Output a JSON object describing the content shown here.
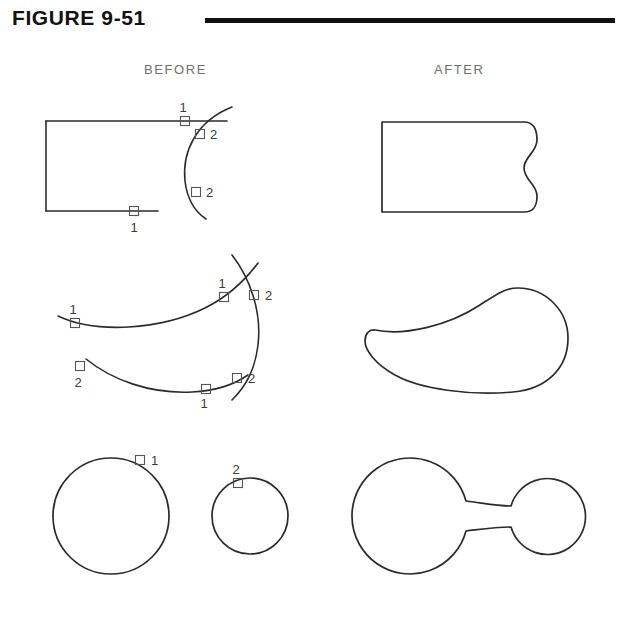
{
  "figure": {
    "title": "FIGURE 9-51",
    "rule_color": "#111111"
  },
  "columns": {
    "before_label": "BEFORE",
    "after_label": "AFTER"
  },
  "style": {
    "line_color": "#2b2b2b",
    "marker_stroke": "#555555",
    "label_color": "#3a3a3a",
    "caption_color": "#6f6f6f",
    "background": "#ffffff"
  },
  "rows": [
    {
      "id": "row-1",
      "name": "rectangle-and-arc",
      "before": {
        "description": "Open rectangle with top and bottom lines extending right, crossed by a convex arc",
        "markers": [
          {
            "label": "1",
            "x": 185,
            "y": 121,
            "label_x": 183,
            "label_y": 112,
            "anchor": "middle"
          },
          {
            "label": "2",
            "x": 200,
            "y": 134,
            "label_x": 210,
            "label_y": 139,
            "anchor": "start"
          },
          {
            "label": "2",
            "x": 196,
            "y": 192,
            "label_x": 206,
            "label_y": 197,
            "anchor": "start"
          },
          {
            "label": "1",
            "x": 134,
            "y": 211,
            "label_x": 134,
            "label_y": 232,
            "anchor": "middle"
          }
        ]
      },
      "after": {
        "description": "Closed region: rectangle with its right side replaced by a concave arc"
      }
    },
    {
      "id": "row-2",
      "name": "three-arcs",
      "before": {
        "description": "Two long arcs crossed by a third vertical arc on the right",
        "markers": [
          {
            "label": "1",
            "x": 75,
            "y": 323,
            "label_x": 73,
            "label_y": 314,
            "anchor": "middle"
          },
          {
            "label": "1",
            "x": 224,
            "y": 297,
            "label_x": 222,
            "label_y": 288,
            "anchor": "middle"
          },
          {
            "label": "2",
            "x": 254,
            "y": 295,
            "label_x": 265,
            "label_y": 300,
            "anchor": "start"
          },
          {
            "label": "2",
            "x": 80,
            "y": 366,
            "label_x": 78,
            "label_y": 387,
            "anchor": "middle"
          },
          {
            "label": "1",
            "x": 206,
            "y": 389,
            "label_x": 204,
            "label_y": 408,
            "anchor": "middle"
          },
          {
            "label": "2",
            "x": 237,
            "y": 378,
            "label_x": 248,
            "label_y": 383,
            "anchor": "start"
          }
        ]
      },
      "after": {
        "description": "Closed crescent-shaped blob formed by trimming and joining the arcs"
      }
    },
    {
      "id": "row-3",
      "name": "two-circles",
      "before": {
        "description": "Large circle and small circle, separate",
        "large_circle": {
          "cx": 111,
          "cy": 516,
          "r": 58
        },
        "small_circle": {
          "cx": 250,
          "cy": 516,
          "r": 38
        },
        "markers": [
          {
            "label": "1",
            "x": 140,
            "y": 460,
            "label_x": 151,
            "label_y": 465,
            "anchor": "start"
          },
          {
            "label": "2",
            "x": 238,
            "y": 483,
            "label_x": 236,
            "label_y": 474,
            "anchor": "middle"
          }
        ]
      },
      "after": {
        "description": "Two circles joined by a filleted neck",
        "large_circle": {
          "cx": 412,
          "cy": 516,
          "r": 58
        },
        "small_circle": {
          "cx": 548,
          "cy": 516,
          "r": 38
        }
      }
    }
  ]
}
